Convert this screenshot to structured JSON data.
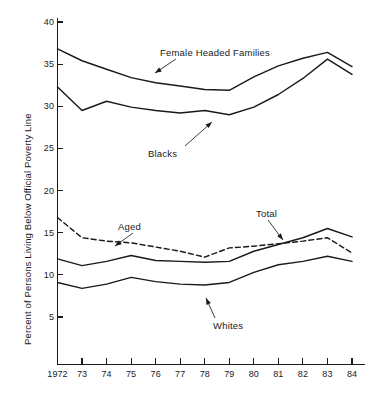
{
  "chart_data": {
    "type": "line",
    "title": "",
    "xlabel": "",
    "ylabel": "Percent of Persons Living Below Official Poverty Line",
    "x": [
      1972,
      1973,
      1974,
      1975,
      1976,
      1977,
      1978,
      1979,
      1980,
      1981,
      1982,
      1983,
      1984
    ],
    "categories": [
      "1972",
      "73",
      "74",
      "75",
      "76",
      "77",
      "78",
      "79",
      "80",
      "81",
      "82",
      "83",
      "84"
    ],
    "xlim": [
      1972,
      1984
    ],
    "ylim": [
      0,
      41
    ],
    "yticks": [
      5,
      10,
      15,
      20,
      25,
      30,
      35,
      40
    ],
    "ytick_labels": [
      "5",
      "10",
      "15",
      "20",
      "25",
      "30",
      "35",
      "40"
    ],
    "grid": false,
    "legend": "inline-annotations",
    "series": [
      {
        "name": "Female Headed Families",
        "style": "solid",
        "values": [
          36.8,
          35.4,
          34.4,
          33.4,
          32.8,
          32.4,
          32.0,
          31.9,
          33.5,
          34.8,
          35.7,
          36.4,
          34.7
        ]
      },
      {
        "name": "Blacks",
        "style": "solid",
        "values": [
          32.3,
          29.5,
          30.6,
          29.9,
          29.5,
          29.2,
          29.5,
          29.0,
          29.9,
          31.4,
          33.3,
          35.6,
          33.8
        ]
      },
      {
        "name": "Aged",
        "style": "dashed",
        "values": [
          16.8,
          14.4,
          14.0,
          13.8,
          13.3,
          12.8,
          12.1,
          13.2,
          13.4,
          13.7,
          14.0,
          14.4,
          12.6
        ]
      },
      {
        "name": "Total",
        "style": "solid",
        "values": [
          11.9,
          11.1,
          11.6,
          12.3,
          11.7,
          11.6,
          11.5,
          11.6,
          12.8,
          13.6,
          14.4,
          15.5,
          14.5
        ]
      },
      {
        "name": "Whites",
        "style": "solid",
        "values": [
          9.1,
          8.4,
          8.9,
          9.7,
          9.2,
          8.9,
          8.8,
          9.1,
          10.3,
          11.2,
          11.6,
          12.2,
          11.6
        ]
      }
    ],
    "annotations": [
      {
        "label": "Female Headed Families",
        "points_to_series": "Female Headed Families"
      },
      {
        "label": "Blacks",
        "points_to_series": "Blacks"
      },
      {
        "label": "Aged",
        "points_to_series": "Aged"
      },
      {
        "label": "Total",
        "points_to_series": "Total"
      },
      {
        "label": "Whites",
        "points_to_series": "Whites"
      }
    ]
  }
}
